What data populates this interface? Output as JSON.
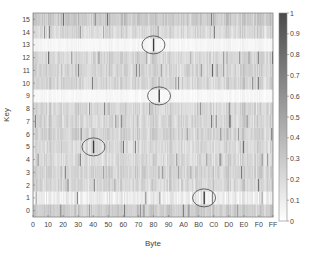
{
  "chart_data": {
    "type": "heatmap",
    "title": "",
    "xlabel": "Byte",
    "ylabel": "Key",
    "x_tick_labels": [
      "0",
      "10",
      "20",
      "30",
      "40",
      "50",
      "60",
      "70",
      "80",
      "90",
      "A0",
      "B0",
      "C0",
      "D0",
      "E0",
      "F0",
      "FF"
    ],
    "x_tick_positions": [
      0,
      16,
      32,
      48,
      64,
      80,
      96,
      112,
      128,
      144,
      160,
      176,
      192,
      208,
      224,
      240,
      255
    ],
    "y_tick_labels": [
      "0",
      "1",
      "2",
      "3",
      "4",
      "5",
      "6",
      "7",
      "8",
      "9",
      "10",
      "11",
      "12",
      "13",
      "14",
      "15"
    ],
    "x_range": [
      0,
      255
    ],
    "y_range": [
      0,
      15
    ],
    "n_columns": 256,
    "n_rows": 16,
    "colorbar": {
      "range": [
        0,
        1
      ],
      "tick_labels": [
        "0",
        "0.1",
        "0.2",
        "0.3",
        "0.4",
        "0.5",
        "0.6",
        "0.7",
        "0.8",
        "0.9",
        "1"
      ],
      "colormap": "gray-reversed (white=0, dark=1)"
    },
    "row_mean_levels": [
      0.32,
      0.12,
      0.26,
      0.28,
      0.24,
      0.24,
      0.28,
      0.26,
      0.26,
      0.05,
      0.27,
      0.27,
      0.26,
      0.06,
      0.24,
      0.34
    ],
    "highlighted_peaks": [
      {
        "key": 13,
        "byte": 128,
        "label": "ellipse"
      },
      {
        "key": 9,
        "byte": 134,
        "label": "ellipse"
      },
      {
        "key": 5,
        "byte": 64,
        "label": "ellipse"
      },
      {
        "key": 1,
        "byte": 182,
        "label": "ellipse"
      }
    ],
    "grid": false,
    "legend_position": "right colorbar"
  }
}
